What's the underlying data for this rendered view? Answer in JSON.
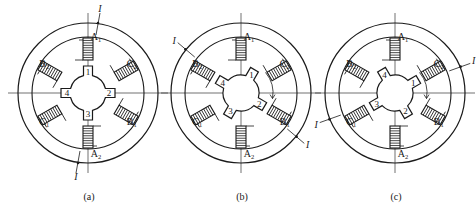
{
  "figure": {
    "stroke_color": "#1a1a1a",
    "background": "#ffffff"
  },
  "poles": [
    {
      "id": "A1",
      "letter": "A",
      "sub": "1",
      "angle": -90
    },
    {
      "id": "C2",
      "letter": "C",
      "sub": "2",
      "angle": -30
    },
    {
      "id": "B1",
      "letter": "B",
      "sub": "1",
      "angle": 30
    },
    {
      "id": "A2",
      "letter": "A",
      "sub": "2",
      "angle": 90
    },
    {
      "id": "C1",
      "letter": "C",
      "sub": "1",
      "angle": 150
    },
    {
      "id": "B2",
      "letter": "B",
      "sub": "2",
      "angle": 210
    }
  ],
  "current_label": "I",
  "panels": [
    {
      "id": "a",
      "caption": "(a)",
      "cx": 88,
      "cy": 93,
      "energized_phase": "A",
      "rotor_offset_deg": 0,
      "rotor_teeth": [
        "1",
        "2",
        "3",
        "4"
      ],
      "show_rotation_arrow": false
    },
    {
      "id": "b",
      "caption": "(b)",
      "cx": 241,
      "cy": 93,
      "energized_phase": "B",
      "rotor_offset_deg": 30,
      "rotor_teeth": [
        "1",
        "2",
        "3",
        "4"
      ],
      "show_rotation_arrow": true
    },
    {
      "id": "c",
      "caption": "(c)",
      "cx": 395,
      "cy": 93,
      "energized_phase": "C",
      "rotor_offset_deg": 60,
      "rotor_teeth": [
        "1",
        "2",
        "3",
        "4"
      ],
      "show_rotation_arrow": true
    }
  ]
}
